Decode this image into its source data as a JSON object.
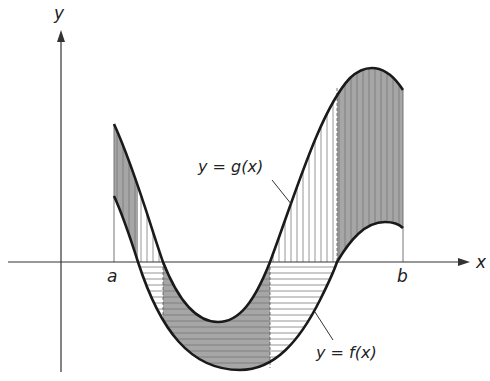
{
  "figure": {
    "axes": {
      "x_label": "x",
      "y_label": "y"
    },
    "bounds": {
      "left_label": "a",
      "right_label": "b"
    },
    "curves": [
      {
        "name": "g",
        "label": "y = g(x)"
      },
      {
        "name": "f",
        "label": "y = f(x)"
      }
    ],
    "colors": {
      "curve": "#1a1a1a",
      "axis": "#333333",
      "dark_fill": "#9a9a9a",
      "hatch": "#8a8a8a",
      "background": "#ffffff"
    }
  }
}
